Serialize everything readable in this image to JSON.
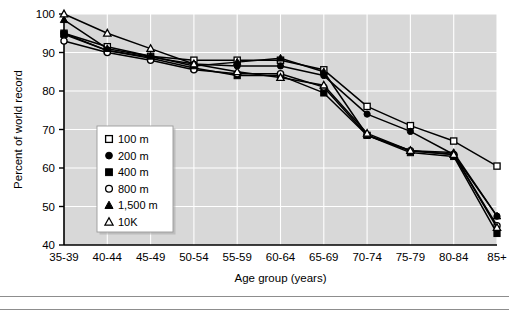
{
  "chart_data": {
    "type": "line",
    "title": "",
    "xlabel": "Age group (years)",
    "ylabel": "Percent of world record",
    "categories": [
      "35-39",
      "40-44",
      "45-49",
      "50-54",
      "55-59",
      "60-64",
      "65-69",
      "70-74",
      "75-79",
      "80-84",
      "85+"
    ],
    "ylim": [
      40,
      100
    ],
    "yticks": [
      40,
      50,
      60,
      70,
      80,
      90,
      100
    ],
    "ytick_labels": [
      "40",
      "50",
      "60",
      "70",
      "80",
      "90",
      "100"
    ],
    "grid": true,
    "legend_position": "lower-left-inside",
    "plot_background": "#d8d8d8",
    "grid_color": "#ffffff",
    "line_color": "#000000",
    "series": [
      {
        "name": "100 m",
        "marker": "open-square",
        "values": [
          95.0,
          91.5,
          89.0,
          88.0,
          88.0,
          88.0,
          85.5,
          76.0,
          71.0,
          67.0,
          60.5
        ]
      },
      {
        "name": "200 m",
        "marker": "filled-circle",
        "values": [
          95.0,
          90.5,
          88.8,
          87.0,
          86.5,
          86.5,
          84.0,
          74.0,
          69.5,
          63.5,
          47.5
        ]
      },
      {
        "name": "400 m",
        "marker": "filled-square",
        "values": [
          94.7,
          90.5,
          88.5,
          86.0,
          84.0,
          84.0,
          79.5,
          68.5,
          64.0,
          63.0,
          43.0
        ]
      },
      {
        "name": "800 m",
        "marker": "open-circle",
        "values": [
          93.0,
          90.0,
          88.0,
          85.5,
          84.5,
          84.5,
          81.0,
          68.5,
          64.5,
          63.5,
          45.0
        ]
      },
      {
        "name": "1,500 m",
        "marker": "filled-triangle",
        "values": [
          98.5,
          91.0,
          89.0,
          86.5,
          87.5,
          88.5,
          85.0,
          68.5,
          64.5,
          64.0,
          47.5
        ]
      },
      {
        "name": "10K",
        "marker": "open-triangle",
        "values": [
          100.0,
          95.0,
          91.0,
          87.0,
          85.0,
          83.5,
          81.5,
          69.0,
          64.5,
          63.5,
          44.5
        ]
      }
    ]
  },
  "legend": {
    "items": [
      {
        "label": "100 m",
        "marker": "open-square"
      },
      {
        "label": "200 m",
        "marker": "filled-circle"
      },
      {
        "label": "400 m",
        "marker": "filled-square"
      },
      {
        "label": "800 m",
        "marker": "open-circle"
      },
      {
        "label": "1,500 m",
        "marker": "filled-triangle"
      },
      {
        "label": "10K",
        "marker": "open-triangle"
      }
    ]
  }
}
